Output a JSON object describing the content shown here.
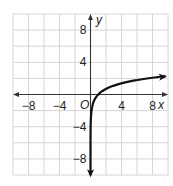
{
  "chart_data": {
    "type": "line",
    "title": "",
    "xlabel": "x",
    "ylabel": "y",
    "xlim": [
      -10,
      10
    ],
    "ylim": [
      -10,
      10
    ],
    "grid": true,
    "grid_step": 2,
    "origin_label": "O",
    "x_ticks": [
      {
        "value": -8,
        "label": "−8"
      },
      {
        "value": -4,
        "label": "−4"
      },
      {
        "value": 4,
        "label": "4"
      },
      {
        "value": 8,
        "label": "8"
      }
    ],
    "y_ticks": [
      {
        "value": 8,
        "label": "8"
      },
      {
        "value": 4,
        "label": "4"
      },
      {
        "value": -4,
        "label": "−4"
      },
      {
        "value": -8,
        "label": "−8"
      }
    ],
    "series": [
      {
        "name": "y = ln(x)",
        "x": [
          5e-05,
          0.001,
          0.01,
          0.05,
          0.1,
          0.2,
          0.4,
          0.7,
          1,
          1.5,
          2,
          3,
          4,
          5,
          6,
          7,
          8,
          9,
          9.6
        ],
        "values": [
          -9.9,
          -6.91,
          -4.61,
          -3.0,
          -2.3,
          -1.61,
          -0.92,
          -0.36,
          0,
          0.41,
          0.69,
          1.1,
          1.39,
          1.61,
          1.79,
          1.95,
          2.08,
          2.2,
          2.26
        ],
        "color": "#111111",
        "arrows": [
          "start",
          "end"
        ]
      }
    ]
  }
}
